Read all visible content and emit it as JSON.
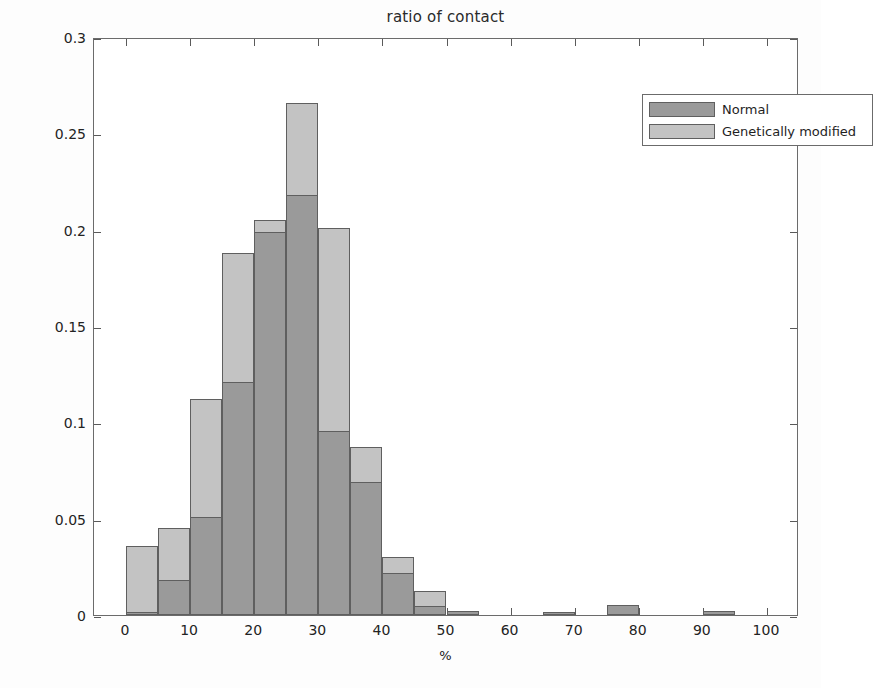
{
  "chart_data": {
    "type": "bar",
    "title": "ratio of contact",
    "xlabel": "%",
    "ylabel": "Percentage of the total",
    "xlim": [
      -5,
      105
    ],
    "ylim": [
      0,
      0.3
    ],
    "grid": false,
    "legend_position": "top-right",
    "bin_width": 5,
    "bin_starts": [
      0,
      5,
      10,
      15,
      20,
      25,
      30,
      35,
      40,
      45,
      50,
      55,
      60,
      65,
      70,
      75,
      80,
      85,
      90,
      95
    ],
    "xticks": [
      "0",
      "10",
      "20",
      "30",
      "40",
      "50",
      "60",
      "70",
      "80",
      "90",
      "100"
    ],
    "xtick_values": [
      0,
      10,
      20,
      30,
      40,
      50,
      60,
      70,
      80,
      90,
      100
    ],
    "yticks": [
      "0",
      "0.05",
      "0.1",
      "0.15",
      "0.2",
      "0.25",
      "0.3"
    ],
    "ytick_values": [
      0,
      0.05,
      0.1,
      0.15,
      0.2,
      0.25,
      0.3
    ],
    "series": [
      {
        "name": "Genetically modified",
        "color": "#c3c3c3",
        "values": [
          0.036,
          0.045,
          0.112,
          0.188,
          0.205,
          0.266,
          0.201,
          0.087,
          0.03,
          0.0125,
          0.002,
          0,
          0,
          0.0015,
          0,
          0.005,
          0,
          0,
          0.002,
          0
        ]
      },
      {
        "name": "Normal",
        "color": "#9a9a9a",
        "values": [
          0.0015,
          0.018,
          0.051,
          0.121,
          0.199,
          0.218,
          0.0955,
          0.069,
          0.022,
          0.0047,
          0.002,
          0,
          0,
          0.0015,
          0,
          0.005,
          0,
          0,
          0.002,
          0
        ]
      }
    ]
  },
  "legend": {
    "entries": [
      {
        "label": "Normal",
        "color": "#9a9a9a"
      },
      {
        "label": "Genetically modified",
        "color": "#c3c3c3"
      }
    ]
  }
}
